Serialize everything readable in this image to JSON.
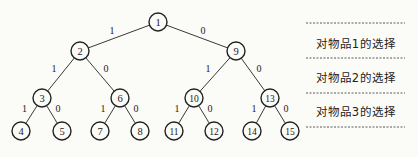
{
  "diagram": {
    "type": "binary-decision-tree",
    "nodes": [
      {
        "id": "1",
        "x": 158,
        "y": 22
      },
      {
        "id": "2",
        "x": 80,
        "y": 51
      },
      {
        "id": "9",
        "x": 236,
        "y": 51
      },
      {
        "id": "3",
        "x": 42,
        "y": 98
      },
      {
        "id": "6",
        "x": 120,
        "y": 98
      },
      {
        "id": "10",
        "x": 194,
        "y": 98
      },
      {
        "id": "13",
        "x": 270,
        "y": 98
      },
      {
        "id": "4",
        "x": 21,
        "y": 131
      },
      {
        "id": "5",
        "x": 62,
        "y": 131
      },
      {
        "id": "7",
        "x": 100,
        "y": 131
      },
      {
        "id": "8",
        "x": 140,
        "y": 131
      },
      {
        "id": "11",
        "x": 174,
        "y": 131
      },
      {
        "id": "12",
        "x": 214,
        "y": 131
      },
      {
        "id": "14",
        "x": 252,
        "y": 131
      },
      {
        "id": "15",
        "x": 290,
        "y": 131
      }
    ],
    "edges": [
      {
        "from": "1",
        "to": "2",
        "label": "1"
      },
      {
        "from": "1",
        "to": "9",
        "label": "0"
      },
      {
        "from": "2",
        "to": "3",
        "label": "1"
      },
      {
        "from": "2",
        "to": "6",
        "label": "0"
      },
      {
        "from": "9",
        "to": "10",
        "label": "1"
      },
      {
        "from": "9",
        "to": "13",
        "label": "0"
      },
      {
        "from": "3",
        "to": "4",
        "label": "1"
      },
      {
        "from": "3",
        "to": "5",
        "label": "0"
      },
      {
        "from": "6",
        "to": "7",
        "label": "1"
      },
      {
        "from": "6",
        "to": "8",
        "label": "0"
      },
      {
        "from": "10",
        "to": "11",
        "label": "1"
      },
      {
        "from": "10",
        "to": "12",
        "label": "0"
      },
      {
        "from": "13",
        "to": "14",
        "label": "1"
      },
      {
        "from": "13",
        "to": "15",
        "label": "0"
      }
    ],
    "level_labels": [
      {
        "text": "对物品1的选择",
        "y": 43
      },
      {
        "text": "对物品2的选择",
        "y": 77
      },
      {
        "text": "对物品3的选择",
        "y": 111
      }
    ],
    "separator_lines_y": [
      23,
      58,
      93,
      127
    ],
    "colors": {
      "line": "#222222",
      "node_fill": "#fbfbf8",
      "dash": "#333333"
    }
  }
}
